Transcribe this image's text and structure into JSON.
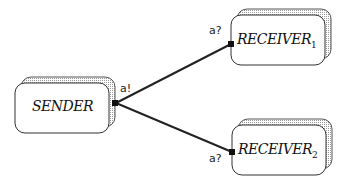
{
  "processes": [
    {
      "id": "sender",
      "name": "SENDER",
      "subscript": ""
    },
    {
      "id": "receiver1",
      "name": "RECEIVER",
      "subscript": "1"
    },
    {
      "id": "receiver2",
      "name": "RECEIVER",
      "subscript": "2"
    }
  ],
  "ports": {
    "sender": "a!",
    "receiver1": "a?",
    "receiver2": "a?"
  },
  "colors": {
    "stroke": "#222222",
    "shadow": "#cfcfcf"
  }
}
